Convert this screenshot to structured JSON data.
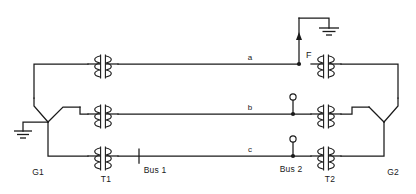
{
  "diagram": {
    "colors": {
      "line": "#1a1a1a",
      "background": "#ffffff"
    },
    "labels": {
      "generator_left": "G1",
      "generator_right": "G2",
      "transformer_left": "T1",
      "transformer_right": "T2",
      "bus_left": "Bus 1",
      "bus_right": "Bus 2",
      "fault": "F",
      "phase_a": "a",
      "phase_b": "b",
      "phase_c": "c"
    },
    "components": [
      {
        "name": "generator-g1",
        "type": "wye-generator",
        "grounded": true,
        "label": "G1"
      },
      {
        "name": "transformer-t1",
        "type": "two-winding-transformer",
        "phases": 3,
        "label": "T1"
      },
      {
        "name": "bus-1",
        "type": "bus",
        "label": "Bus 1"
      },
      {
        "name": "transmission-line-a",
        "type": "line",
        "label": "a"
      },
      {
        "name": "transmission-line-b",
        "type": "line",
        "label": "b"
      },
      {
        "name": "transmission-line-c",
        "type": "line",
        "label": "c"
      },
      {
        "name": "fault-point",
        "type": "line-to-ground-fault",
        "label": "F",
        "phase": "a"
      },
      {
        "name": "bus-2",
        "type": "bus",
        "label": "Bus 2"
      },
      {
        "name": "transformer-t2",
        "type": "two-winding-transformer",
        "phases": 3,
        "label": "T2"
      },
      {
        "name": "generator-g2",
        "type": "wye-generator",
        "grounded": false,
        "label": "G2"
      }
    ]
  }
}
